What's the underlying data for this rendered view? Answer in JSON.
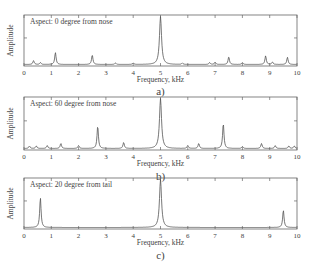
{
  "chart_data": [
    {
      "type": "line",
      "panel": "a)",
      "annotation": "Aspect: 0 degree from nose",
      "xlabel": "Frequency, kHz",
      "ylabel": "Amplitude",
      "xlim": [
        0,
        10
      ],
      "xticks": [
        "0",
        "1",
        "2",
        "3",
        "4",
        "5",
        "6",
        "7",
        "8",
        "9",
        "10"
      ],
      "peaks": [
        {
          "x": 0.35,
          "y": 0.08
        },
        {
          "x": 0.6,
          "y": 0.04
        },
        {
          "x": 1.15,
          "y": 0.25
        },
        {
          "x": 2.5,
          "y": 0.2
        },
        {
          "x": 3.35,
          "y": 0.03
        },
        {
          "x": 4.0,
          "y": 0.03
        },
        {
          "x": 5.0,
          "y": 1.0
        },
        {
          "x": 5.8,
          "y": 0.03
        },
        {
          "x": 6.8,
          "y": 0.04
        },
        {
          "x": 7.0,
          "y": 0.05
        },
        {
          "x": 7.5,
          "y": 0.16
        },
        {
          "x": 8.0,
          "y": 0.04
        },
        {
          "x": 8.85,
          "y": 0.18
        },
        {
          "x": 9.1,
          "y": 0.05
        },
        {
          "x": 9.65,
          "y": 0.15
        }
      ]
    },
    {
      "type": "line",
      "panel": "b)",
      "annotation": "Aspect: 60 degree from nose",
      "xlabel": "Frequency, kHz",
      "ylabel": "Amplitude",
      "xlim": [
        0,
        10
      ],
      "xticks": [
        "0",
        "1",
        "2",
        "3",
        "4",
        "5",
        "6",
        "7",
        "8",
        "9",
        "10"
      ],
      "peaks": [
        {
          "x": 0.2,
          "y": 0.05
        },
        {
          "x": 0.45,
          "y": 0.05
        },
        {
          "x": 0.85,
          "y": 0.06
        },
        {
          "x": 1.35,
          "y": 0.1
        },
        {
          "x": 2.0,
          "y": 0.06
        },
        {
          "x": 2.7,
          "y": 0.45
        },
        {
          "x": 3.65,
          "y": 0.12
        },
        {
          "x": 5.0,
          "y": 1.0
        },
        {
          "x": 6.0,
          "y": 0.06
        },
        {
          "x": 6.4,
          "y": 0.1
        },
        {
          "x": 7.3,
          "y": 0.5
        },
        {
          "x": 8.0,
          "y": 0.04
        },
        {
          "x": 8.7,
          "y": 0.1
        },
        {
          "x": 9.2,
          "y": 0.06
        },
        {
          "x": 9.7,
          "y": 0.05
        },
        {
          "x": 9.9,
          "y": 0.05
        }
      ]
    },
    {
      "type": "line",
      "panel": "c)",
      "annotation": "Aspect: 20 degree from tail",
      "xlabel": "Frequency, kHz",
      "ylabel": "Amplitude",
      "xlim": [
        0,
        10
      ],
      "xticks": [
        "0",
        "1",
        "2",
        "3",
        "4",
        "5",
        "6",
        "7",
        "8",
        "9",
        "10"
      ],
      "peaks": [
        {
          "x": 0.6,
          "y": 0.62
        },
        {
          "x": 5.0,
          "y": 1.0
        },
        {
          "x": 9.5,
          "y": 0.36
        }
      ]
    }
  ],
  "colors": {
    "line": "#555555",
    "axis": "#666666",
    "text": "#444444"
  }
}
